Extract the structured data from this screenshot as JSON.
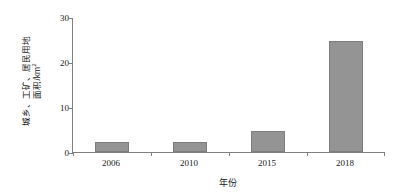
{
  "chart_data": {
    "type": "bar",
    "title": "",
    "categories": [
      "2006",
      "2010",
      "2015",
      "2018"
    ],
    "values": [
      2.3,
      2.3,
      4.7,
      24.9
    ],
    "series": [
      {
        "name": "城乡、工矿、居民用地面积",
        "values": [
          2.3,
          2.3,
          4.7,
          24.9
        ]
      }
    ],
    "xlabel": "年份",
    "ylabel_line1": "城乡、工矿、居民用地",
    "ylabel_line2": "面积/km",
    "ylabel_superscript": "2",
    "ylabel": "城乡、工矿、居民用地面积/km²",
    "ylim": [
      0,
      30
    ],
    "yticks": [
      "0",
      "10",
      "20",
      "30"
    ],
    "ytick_values": [
      0,
      10,
      20,
      30
    ],
    "grid": false,
    "legend": false,
    "bar_color": "#949494",
    "bar_edge_color": "#7d7d7d",
    "axis_color": "#808080",
    "text_color": "#1a1a1a",
    "background": "#ffffff"
  }
}
